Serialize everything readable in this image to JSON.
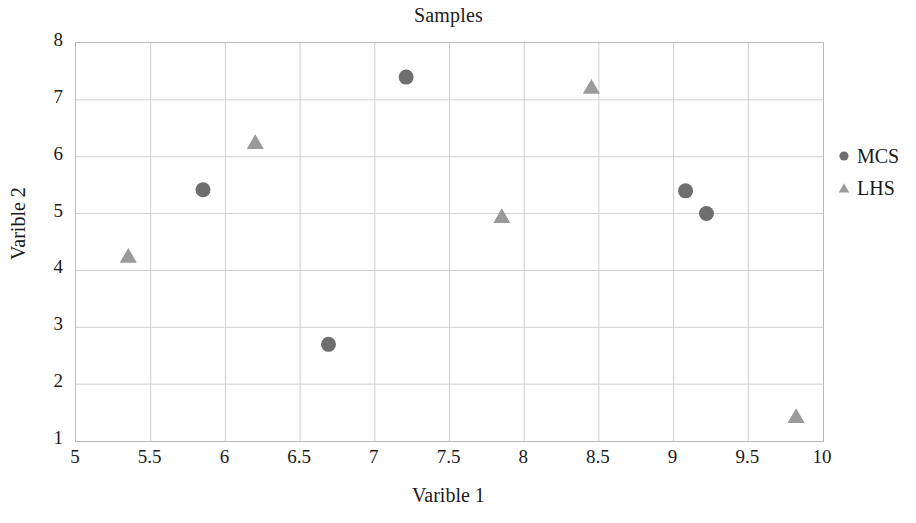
{
  "chart_data": {
    "type": "scatter",
    "title": "Samples",
    "xlabel": "Varible 1",
    "ylabel": "Varible 2",
    "xlim": [
      5,
      10
    ],
    "ylim": [
      1,
      8
    ],
    "grid": true,
    "legend_position": "right",
    "xticks": [
      "5",
      "5.5",
      "6",
      "6.5",
      "7",
      "7.5",
      "8",
      "8.5",
      "9",
      "9.5",
      "10"
    ],
    "xtick_values": [
      5,
      5.5,
      6,
      6.5,
      7,
      7.5,
      8,
      8.5,
      9,
      9.5,
      10
    ],
    "yticks": [
      "1",
      "2",
      "3",
      "4",
      "5",
      "6",
      "7",
      "8"
    ],
    "ytick_values": [
      1,
      2,
      3,
      4,
      5,
      6,
      7,
      8
    ],
    "series": [
      {
        "name": "MCS",
        "marker": "circle",
        "color": "#6e6e6e",
        "points": [
          {
            "x": 5.85,
            "y": 5.42
          },
          {
            "x": 6.69,
            "y": 2.7
          },
          {
            "x": 7.21,
            "y": 7.4
          },
          {
            "x": 9.08,
            "y": 5.4
          },
          {
            "x": 9.22,
            "y": 5.0
          }
        ]
      },
      {
        "name": "LHS",
        "marker": "triangle",
        "color": "#9a9a9a",
        "points": [
          {
            "x": 5.35,
            "y": 4.25
          },
          {
            "x": 6.2,
            "y": 6.25
          },
          {
            "x": 7.85,
            "y": 4.95
          },
          {
            "x": 8.45,
            "y": 7.22
          },
          {
            "x": 9.82,
            "y": 1.43
          }
        ]
      }
    ],
    "grid_color": "#cfcfcf",
    "frame_color": "#b9b9b9",
    "background_color": "#ffffff"
  },
  "legend": {
    "entries": [
      {
        "label": "MCS",
        "marker": "circle",
        "color": "#6e6e6e"
      },
      {
        "label": "LHS",
        "marker": "triangle",
        "color": "#9a9a9a"
      }
    ]
  }
}
